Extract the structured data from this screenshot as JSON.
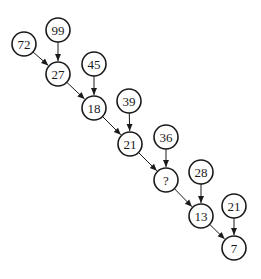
{
  "diagram": {
    "type": "number-tree-puzzle",
    "nodes": [
      {
        "id": "n72",
        "label": "72",
        "x": 24,
        "y": 44
      },
      {
        "id": "n99",
        "label": "99",
        "x": 58,
        "y": 30
      },
      {
        "id": "n27",
        "label": "27",
        "x": 58,
        "y": 74
      },
      {
        "id": "n45",
        "label": "45",
        "x": 94,
        "y": 64
      },
      {
        "id": "n18",
        "label": "18",
        "x": 94,
        "y": 108
      },
      {
        "id": "n39",
        "label": "39",
        "x": 129,
        "y": 101
      },
      {
        "id": "n21a",
        "label": "21",
        "x": 130,
        "y": 144
      },
      {
        "id": "n36",
        "label": "36",
        "x": 166,
        "y": 137
      },
      {
        "id": "nq",
        "label": "?",
        "x": 166,
        "y": 180
      },
      {
        "id": "n28",
        "label": "28",
        "x": 201,
        "y": 172
      },
      {
        "id": "n13",
        "label": "13",
        "x": 201,
        "y": 216
      },
      {
        "id": "n21b",
        "label": "21",
        "x": 234,
        "y": 206
      },
      {
        "id": "n7",
        "label": "7",
        "x": 234,
        "y": 248
      }
    ],
    "edges": [
      {
        "from": "n72",
        "to": "n27"
      },
      {
        "from": "n99",
        "to": "n27"
      },
      {
        "from": "n27",
        "to": "n18"
      },
      {
        "from": "n45",
        "to": "n18"
      },
      {
        "from": "n18",
        "to": "n21a"
      },
      {
        "from": "n39",
        "to": "n21a"
      },
      {
        "from": "n21a",
        "to": "nq"
      },
      {
        "from": "n36",
        "to": "nq"
      },
      {
        "from": "nq",
        "to": "n13"
      },
      {
        "from": "n28",
        "to": "n13"
      },
      {
        "from": "n13",
        "to": "n7"
      },
      {
        "from": "n21b",
        "to": "n7"
      }
    ],
    "node_radius": 12,
    "colors": {
      "stroke": "#1a1a1a",
      "fill": "#ffffff"
    }
  }
}
